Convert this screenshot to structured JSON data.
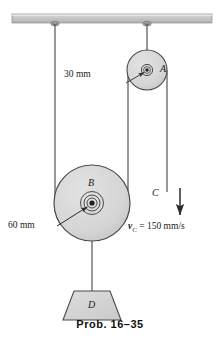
{
  "figure": {
    "caption": "Prob. 16–35",
    "colors": {
      "body_fill": "#d6d6d6",
      "ceiling_fill": "#c9c9c9",
      "stroke": "#3a3a3a",
      "text": "#1a1a1a",
      "background": "#ffffff"
    },
    "labels": {
      "pulley_a": "A",
      "pulley_b": "B",
      "cord_c": "C",
      "block_d": "D",
      "radius_a": "30 mm",
      "radius_b": "60 mm",
      "velocity_symbol": "v",
      "velocity_subscript": "C",
      "velocity_equation_rest": "= 150 mm/s"
    },
    "values": {
      "radius_a_mm": 30,
      "radius_b_mm": 60,
      "velocity_c_mm_per_s": 150
    },
    "geometry": {
      "ceiling": {
        "x": 12,
        "y": 14,
        "width": 200,
        "height": 9
      },
      "pulley_a": {
        "cx": 147,
        "cy": 70,
        "r": 20
      },
      "pulley_b": {
        "cx": 92,
        "cy": 203,
        "r": 38
      },
      "block_d": {
        "cx": 92,
        "top_y": 291,
        "bottom_y": 320,
        "top_w": 36,
        "bottom_w": 58
      },
      "cords": {
        "left_x": 55,
        "mid_x": 128,
        "right_x": 167
      },
      "velocity_arrow": {
        "x": 180,
        "y_start": 188,
        "y_end": 219
      }
    }
  }
}
